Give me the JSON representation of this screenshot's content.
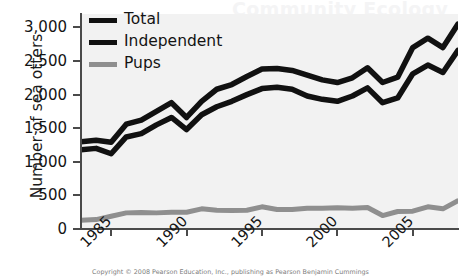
{
  "figure": {
    "watermark": "Community Ecology",
    "copyright": "Copyright © 2008 Pearson Education, Inc., publishing as Pearson Benjamin Cummings"
  },
  "legend": {
    "position": "top-left",
    "items": [
      {
        "label": "Total",
        "color": "#111111"
      },
      {
        "label": "Independent",
        "color": "#111111"
      },
      {
        "label": "Pups",
        "color": "#8f8f8f"
      }
    ]
  },
  "chart_data": {
    "type": "line",
    "title": "",
    "xlabel": "",
    "ylabel": "Number of sea otters",
    "xlim": [
      1983,
      2008
    ],
    "ylim": [
      0,
      3200
    ],
    "grid": false,
    "background": "#f2f2f2",
    "yticks": [
      0,
      500,
      1000,
      1500,
      2000,
      2500,
      3000
    ],
    "ytick_labels": [
      "0",
      "500",
      "1,000",
      "1,500",
      "2,000",
      "2,500",
      "3,000"
    ],
    "xticks": [
      1985,
      1990,
      1995,
      2000,
      2005
    ],
    "xtick_labels": [
      "1985",
      "1990",
      "1995",
      "2000",
      "2005"
    ],
    "x": [
      1983,
      1984,
      1985,
      1986,
      1987,
      1988,
      1989,
      1990,
      1991,
      1992,
      1993,
      1994,
      1995,
      1996,
      1997,
      1998,
      1999,
      2000,
      2001,
      2002,
      2003,
      2004,
      2005,
      2006,
      2007,
      2008
    ],
    "series": [
      {
        "name": "Total",
        "color": "#111111",
        "values": [
          1300,
          1320,
          1290,
          1560,
          1620,
          1750,
          1880,
          1660,
          1900,
          2080,
          2150,
          2270,
          2380,
          2390,
          2360,
          2290,
          2220,
          2180,
          2250,
          2400,
          2180,
          2260,
          2700,
          2840,
          2700,
          3050
        ]
      },
      {
        "name": "Independent",
        "color": "#111111",
        "values": [
          1180,
          1200,
          1120,
          1370,
          1420,
          1550,
          1660,
          1480,
          1700,
          1820,
          1900,
          2000,
          2090,
          2110,
          2080,
          1980,
          1930,
          1900,
          1980,
          2100,
          1880,
          1950,
          2310,
          2440,
          2330,
          2660
        ]
      },
      {
        "name": "Pups",
        "color": "#8f8f8f",
        "values": [
          130,
          140,
          190,
          240,
          245,
          240,
          250,
          250,
          300,
          280,
          275,
          280,
          330,
          290,
          290,
          310,
          310,
          315,
          310,
          320,
          200,
          260,
          265,
          330,
          300,
          420
        ]
      }
    ]
  }
}
